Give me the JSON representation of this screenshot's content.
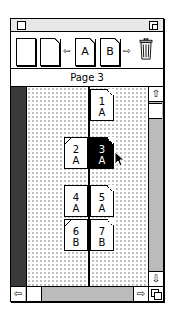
{
  "window": {
    "title": "",
    "controls": {
      "close_box": "close-box",
      "zoom_box": "zoom-box"
    }
  },
  "toolbar": {
    "items": [
      {
        "id": "blank-page",
        "icon": "blank-page-icon",
        "label": ""
      },
      {
        "id": "new-page",
        "icon": "folded-page-icon",
        "label": ""
      },
      {
        "id": "prev",
        "icon": "left-arrow-icon",
        "label": "⇦"
      },
      {
        "id": "master-a",
        "icon": "master-page-icon",
        "label": "A"
      },
      {
        "id": "master-b",
        "icon": "master-page-icon",
        "label": "B"
      },
      {
        "id": "next",
        "icon": "right-arrow-icon",
        "label": "⇨"
      },
      {
        "id": "trash",
        "icon": "trash-icon",
        "label": ""
      }
    ]
  },
  "status": {
    "label": "Page 3"
  },
  "spreads": [
    {
      "left": null,
      "right": {
        "number": "1",
        "master": "A",
        "selected": false
      }
    },
    {
      "left": {
        "number": "2",
        "master": "A",
        "selected": false
      },
      "right": {
        "number": "3",
        "master": "A",
        "selected": true
      }
    },
    {
      "left": {
        "number": "4",
        "master": "A",
        "selected": false
      },
      "right": {
        "number": "5",
        "master": "A",
        "selected": false
      }
    },
    {
      "left": {
        "number": "6",
        "master": "B",
        "selected": false
      },
      "right": {
        "number": "7",
        "master": "B",
        "selected": false
      }
    }
  ],
  "scrollbars": {
    "vertical": {
      "up": "⇧",
      "down": "⇩"
    },
    "horizontal": {
      "left": "⇦",
      "right": "⇨"
    }
  }
}
